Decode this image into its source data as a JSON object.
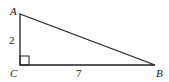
{
  "diagram": {
    "type": "right-triangle",
    "vertices": {
      "A": {
        "label": "A",
        "x": 20,
        "y": 14
      },
      "B": {
        "label": "B",
        "x": 155,
        "y": 65
      },
      "C": {
        "label": "C",
        "x": 20,
        "y": 65
      }
    },
    "sides": {
      "AC": {
        "label": "2"
      },
      "CB": {
        "label": "7"
      }
    },
    "right_angle_at": "C",
    "stroke_color": "#222222"
  }
}
